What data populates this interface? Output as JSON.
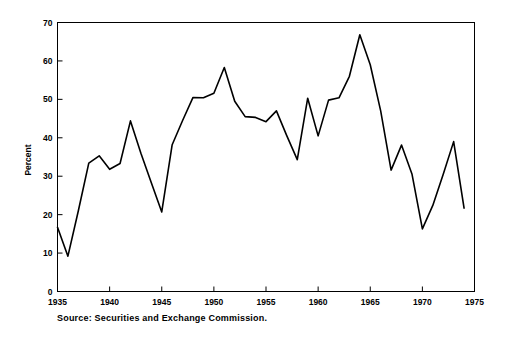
{
  "chart_data": {
    "type": "line",
    "title": "",
    "subtitle": "",
    "xlabel": "",
    "ylabel": "Percent",
    "xlim": [
      1935,
      1975
    ],
    "ylim": [
      0,
      70
    ],
    "grid": false,
    "legend": null,
    "xticks": [
      1935,
      1940,
      1945,
      1950,
      1955,
      1960,
      1965,
      1970,
      1975
    ],
    "xtick_labels": [
      "1935",
      "1940",
      "1945",
      "1950",
      "1955",
      "1960",
      "1965",
      "1970",
      "1975"
    ],
    "yticks": [
      0,
      10,
      20,
      30,
      40,
      50,
      60,
      70
    ],
    "ytick_labels": [
      "0",
      "10",
      "20",
      "30",
      "40",
      "50",
      "60",
      "70"
    ],
    "line_color": "#000000",
    "line_width": 1.6,
    "series": [
      {
        "name": "Percent",
        "x": [
          1935,
          1936,
          1937,
          1938,
          1939,
          1940,
          1941,
          1942,
          1943,
          1944,
          1945,
          1946,
          1947,
          1948,
          1949,
          1950,
          1951,
          1952,
          1953,
          1954,
          1955,
          1956,
          1957,
          1958,
          1959,
          1960,
          1961,
          1962,
          1963,
          1964,
          1965,
          1966,
          1967,
          1968,
          1969,
          1970,
          1971,
          1972,
          1973,
          1974
        ],
        "values": [
          16.7,
          9.2,
          21.0,
          33.4,
          35.3,
          31.8,
          33.3,
          44.4,
          36.0,
          28.3,
          20.7,
          38.2,
          44.5,
          50.5,
          50.4,
          51.6,
          58.3,
          49.5,
          45.5,
          45.3,
          44.2,
          47.0,
          40.5,
          34.3,
          50.3,
          40.5,
          49.8,
          50.4,
          56.0,
          66.8,
          59.0,
          47.0,
          31.6,
          38.1,
          30.6,
          16.3,
          22.4,
          30.5,
          39.0,
          21.7
        ]
      }
    ],
    "annotations": [
      {
        "name": "source-note",
        "text": "Source: Securities and Exchange Commission."
      }
    ]
  },
  "axis": {
    "y_title": "Percent"
  },
  "note": {
    "source_text": "Source: Securities and Exchange Commission."
  }
}
